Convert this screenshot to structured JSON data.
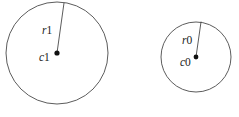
{
  "figure": {
    "background_color": "#ffffff",
    "stroke_color": "#4a4a4a",
    "dot_color": "#111111",
    "text_color": "#1a1a1a",
    "width": 239,
    "height": 117
  },
  "shapes": [
    {
      "name": "large-circle",
      "center_label_symbol": "c",
      "center_label_index": "1",
      "center_label": "c1",
      "radius_label_symbol": "r",
      "radius_label_index": "1",
      "radius_label": "r1",
      "cx": 57,
      "cy": 53,
      "r": 51,
      "radius_end_x": 64,
      "radius_end_y": 3
    },
    {
      "name": "small-circle",
      "center_label_symbol": "c",
      "center_label_index": "0",
      "center_label": "c0",
      "radius_label_symbol": "r",
      "radius_label_index": "0",
      "radius_label": "r0",
      "cx": 196,
      "cy": 57,
      "r": 35,
      "radius_end_x": 201,
      "radius_end_y": 22
    }
  ]
}
